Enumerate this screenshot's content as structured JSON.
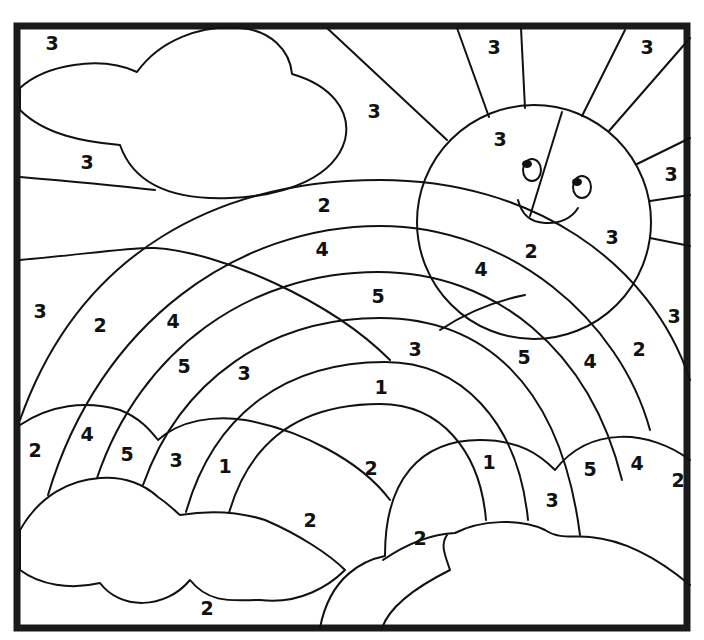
{
  "page": {
    "type": "color-by-number",
    "colors": {
      "line": "#111111",
      "frame": "#1a1a1a",
      "background": "#ffffff"
    }
  },
  "labels": [
    {
      "id": "sky-top-left",
      "value": "3",
      "x": 52,
      "y": 44
    },
    {
      "id": "sky-above-cloud-gap",
      "value": "3",
      "x": 87,
      "y": 163
    },
    {
      "id": "sky-between-rays",
      "value": "3",
      "x": 374,
      "y": 112
    },
    {
      "id": "ray-top-1",
      "value": "3",
      "x": 494,
      "y": 48
    },
    {
      "id": "ray-top-2",
      "value": "3",
      "x": 647,
      "y": 48
    },
    {
      "id": "sun-left",
      "value": "3",
      "x": 500,
      "y": 140
    },
    {
      "id": "ray-right-1",
      "value": "3",
      "x": 671,
      "y": 175
    },
    {
      "id": "sun-right",
      "value": "3",
      "x": 612,
      "y": 238
    },
    {
      "id": "band-2-top",
      "value": "2",
      "x": 324,
      "y": 206
    },
    {
      "id": "band-2-sun",
      "value": "2",
      "x": 531,
      "y": 252
    },
    {
      "id": "band-4-top",
      "value": "4",
      "x": 322,
      "y": 250
    },
    {
      "id": "band-4-sun",
      "value": "4",
      "x": 481,
      "y": 270
    },
    {
      "id": "band-5-top",
      "value": "5",
      "x": 378,
      "y": 297
    },
    {
      "id": "sky-left",
      "value": "3",
      "x": 40,
      "y": 312
    },
    {
      "id": "band-2-left",
      "value": "2",
      "x": 100,
      "y": 326
    },
    {
      "id": "band-4-left",
      "value": "4",
      "x": 173,
      "y": 322
    },
    {
      "id": "ray-right-low",
      "value": "3",
      "x": 674,
      "y": 317
    },
    {
      "id": "band-5-left",
      "value": "5",
      "x": 184,
      "y": 367
    },
    {
      "id": "band-3-left",
      "value": "3",
      "x": 244,
      "y": 374
    },
    {
      "id": "band-3-top",
      "value": "3",
      "x": 415,
      "y": 350
    },
    {
      "id": "band-5-right",
      "value": "5",
      "x": 524,
      "y": 358
    },
    {
      "id": "band-4-right",
      "value": "4",
      "x": 590,
      "y": 362
    },
    {
      "id": "band-2-right",
      "value": "2",
      "x": 639,
      "y": 350
    },
    {
      "id": "band-1-top",
      "value": "1",
      "x": 381,
      "y": 388
    },
    {
      "id": "cloud-l-2",
      "value": "2",
      "x": 35,
      "y": 451
    },
    {
      "id": "cloud-l-4",
      "value": "4",
      "x": 87,
      "y": 435
    },
    {
      "id": "cloud-l-5",
      "value": "5",
      "x": 127,
      "y": 455
    },
    {
      "id": "cloud-l-3",
      "value": "3",
      "x": 176,
      "y": 461
    },
    {
      "id": "cloud-l-1",
      "value": "1",
      "x": 225,
      "y": 467
    },
    {
      "id": "inner-arc-2",
      "value": "2",
      "x": 371,
      "y": 469
    },
    {
      "id": "cloud-r-1",
      "value": "1",
      "x": 489,
      "y": 463
    },
    {
      "id": "cloud-r-5",
      "value": "5",
      "x": 590,
      "y": 470
    },
    {
      "id": "cloud-r-4",
      "value": "4",
      "x": 637,
      "y": 464
    },
    {
      "id": "cloud-r-2",
      "value": "2",
      "x": 678,
      "y": 481
    },
    {
      "id": "cloud-r-3",
      "value": "3",
      "x": 552,
      "y": 501
    },
    {
      "id": "ground-center-2",
      "value": "2",
      "x": 310,
      "y": 521
    },
    {
      "id": "ground-right-2",
      "value": "2",
      "x": 420,
      "y": 539
    },
    {
      "id": "ground-bottom-2",
      "value": "2",
      "x": 207,
      "y": 609
    }
  ]
}
